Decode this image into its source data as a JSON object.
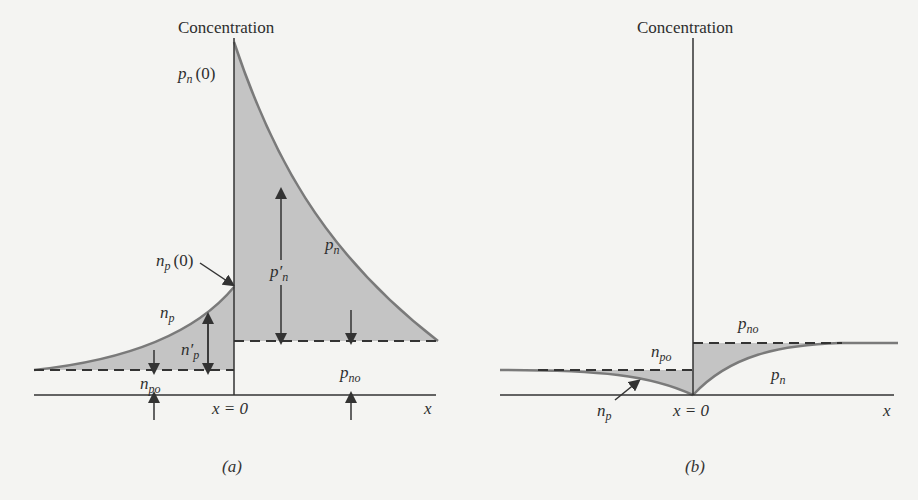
{
  "panels": [
    {
      "id": "a",
      "caption": "(a)",
      "y_axis_label": "Concentration",
      "x_axis_label": "x",
      "junction_label": "x = 0",
      "labels": {
        "pn0": "p",
        "pn0_sub": "n",
        "pn0_arg": "(0)",
        "np0": "n",
        "np0_sub": "p",
        "np0_arg": "(0)",
        "np": "n",
        "np_sub": "p",
        "np_prime": "n′",
        "np_prime_sub": "p",
        "npo": "n",
        "npo_sub": "po",
        "pn": "p",
        "pn_sub": "n",
        "pn_prime": "p′",
        "pn_prime_sub": "n",
        "pno": "p",
        "pno_sub": "no"
      }
    },
    {
      "id": "b",
      "caption": "(b)",
      "y_axis_label": "Concentration",
      "x_axis_label": "x",
      "junction_label": "x = 0",
      "labels": {
        "pno": "p",
        "pno_sub": "no",
        "npo": "n",
        "npo_sub": "po",
        "pn": "p",
        "pn_sub": "n",
        "np": "n",
        "np_sub": "p"
      }
    }
  ],
  "colors": {
    "fill": "#c4c4c4",
    "curve": "#7a7a7a",
    "line": "#3a3a3a",
    "background": "#f4f4f2"
  }
}
